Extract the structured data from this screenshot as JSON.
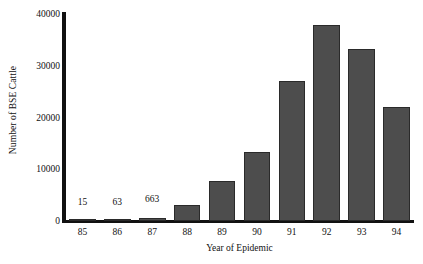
{
  "chart_data": {
    "type": "bar",
    "title": "",
    "xlabel": "Year of Epidemic",
    "ylabel": "Number of BSE Cattle",
    "categories": [
      "85",
      "86",
      "87",
      "88",
      "89",
      "90",
      "91",
      "92",
      "93",
      "94"
    ],
    "values": [
      15,
      63,
      663,
      3100,
      7700,
      13400,
      27000,
      37800,
      33300,
      22100
    ],
    "point_labels": [
      "15",
      "63",
      "663",
      "",
      "",
      "",
      "",
      "",
      "",
      ""
    ],
    "ylim": [
      0,
      40000
    ],
    "ytick_values": [
      0,
      10000,
      20000,
      30000,
      40000
    ],
    "ytick_labels": [
      "0",
      "10000",
      "20000",
      "30000",
      "40000"
    ],
    "grid": false,
    "legend": false,
    "bar_color": "#4d4d4d",
    "bar_edge_color": "#2a2a2a",
    "axis_color": "#111111",
    "background": "#ffffff"
  }
}
